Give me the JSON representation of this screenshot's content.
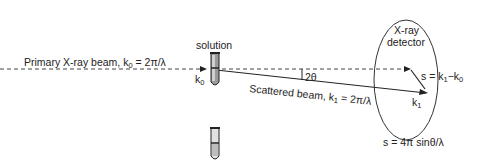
{
  "diagram": {
    "primary_beam": {
      "text": "Primary X-ray beam, k",
      "sub": "0",
      "suffix": " = 2π/λ"
    },
    "solution_label": "solution",
    "solvent_label": "solvent",
    "k0_label": {
      "text": "k",
      "sub": "0"
    },
    "scattered_beam": {
      "text": "Scattered beam, k",
      "sub": "1",
      "suffix": " = 2π/λ"
    },
    "angle_label": "2θ",
    "detector_label_line1": "X-ray",
    "detector_label_line2": "detector",
    "s_vector": {
      "text": "s = k",
      "sub1": "1",
      "mid": "−k",
      "sub2": "0"
    },
    "k1_label": {
      "text": "k",
      "sub": "1"
    },
    "s_formula": "s = 4π sinθ/λ",
    "colors": {
      "line": "#222222",
      "tube_fill": "#8a8a8a",
      "tube_light": "#d0d0d0"
    }
  }
}
